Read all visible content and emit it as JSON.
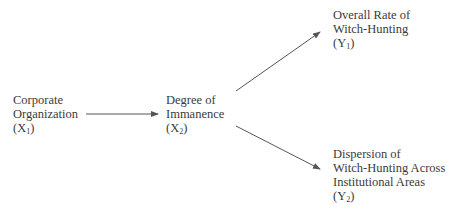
{
  "diagram": {
    "type": "causal-path-diagram",
    "nodes": [
      {
        "id": "X1",
        "lines": [
          "Corporate",
          "Organization"
        ],
        "symbol": "X",
        "subscript": "1"
      },
      {
        "id": "X2",
        "lines": [
          "Degree of",
          "Immanence"
        ],
        "symbol": "X",
        "subscript": "2"
      },
      {
        "id": "Y1",
        "lines": [
          "Overall Rate of",
          "Witch-Hunting"
        ],
        "symbol": "Y",
        "subscript": "1"
      },
      {
        "id": "Y2",
        "lines": [
          "Dispersion of",
          "Witch-Hunting Across",
          "Institutional Areas"
        ],
        "symbol": "Y",
        "subscript": "2"
      }
    ],
    "edges": [
      {
        "from": "X1",
        "to": "X2"
      },
      {
        "from": "X2",
        "to": "Y1"
      },
      {
        "from": "X2",
        "to": "Y2"
      }
    ],
    "colors": {
      "text": "#3a3a3a",
      "arrow": "#555555"
    }
  }
}
